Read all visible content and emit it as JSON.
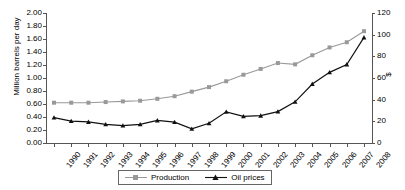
{
  "chart_data": {
    "type": "line",
    "title": "",
    "xlabel": "",
    "ylabel": "Million barrels per day",
    "ylabel_right": "$",
    "categories": [
      "1990",
      "1991",
      "1992",
      "1993",
      "1994",
      "1995",
      "1996",
      "1997",
      "1998",
      "1999",
      "2000",
      "2001",
      "2002",
      "2003",
      "2004",
      "2005",
      "2006",
      "2007",
      "2008"
    ],
    "ylim": [
      0,
      2.0
    ],
    "ylim_right": [
      0,
      120
    ],
    "yticks": [
      "0.00",
      "0.20",
      "0.40",
      "0.60",
      "0.80",
      "1.00",
      "1.20",
      "1.40",
      "1.60",
      "1.80",
      "2.00"
    ],
    "yticks_right": [
      "0",
      "20",
      "40",
      "60",
      "80",
      "100",
      "120"
    ],
    "grid": false,
    "legend_position": "bottom",
    "series": [
      {
        "name": "Production",
        "axis": "left",
        "color": "#999999",
        "marker": "square",
        "values": [
          0.62,
          0.62,
          0.62,
          0.63,
          0.64,
          0.65,
          0.68,
          0.72,
          0.79,
          0.86,
          0.95,
          1.05,
          1.14,
          1.23,
          1.21,
          1.35,
          1.47,
          1.55,
          1.72
        ]
      },
      {
        "name": "Oil prices",
        "axis": "right",
        "color": "#111111",
        "marker": "triangle",
        "values": [
          23.5,
          20.2,
          19.5,
          17.2,
          16.1,
          17.2,
          20.8,
          19.3,
          13.1,
          18.2,
          28.8,
          24.6,
          25.2,
          29.0,
          38.0,
          54.5,
          65.2,
          72.5,
          97.5
        ]
      }
    ]
  },
  "legend": {
    "items": [
      {
        "label": "Production"
      },
      {
        "label": "Oil prices"
      }
    ]
  }
}
